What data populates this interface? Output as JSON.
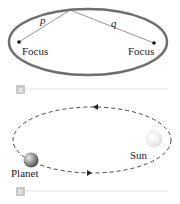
{
  "panel_a": {
    "label": "a",
    "segments": {
      "p": "p",
      "q": "q"
    },
    "focus_left": "Focus",
    "focus_right": "Focus",
    "ellipse_color": "#6e6e6e"
  },
  "panel_b": {
    "label": "b",
    "planet_label": "Planet",
    "sun_label": "Sun",
    "orbit_style": "dashed"
  },
  "colors": {
    "tag_bg": "#c9c9c9",
    "divider": "#e3e3e3"
  }
}
